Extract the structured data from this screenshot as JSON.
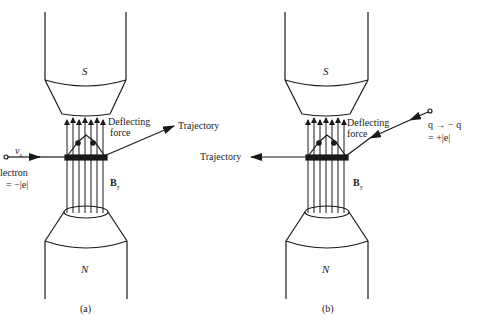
{
  "panels": [
    {
      "id": "a",
      "caption": "(a)",
      "top_pole": "S",
      "bottom_pole": "N",
      "field_label": "B",
      "field_subscript": "y",
      "force_label_line1": "Deflecting",
      "force_label_line2": "force",
      "trajectory_label": "Trajectory",
      "velocity_label": "v",
      "velocity_subscript": "x",
      "particle_label": "lectron",
      "charge_label": "= −|e|"
    },
    {
      "id": "b",
      "caption": "(b)",
      "top_pole": "S",
      "bottom_pole": "N",
      "field_label": "B",
      "field_subscript": "y",
      "force_label_line1": "Deflecting",
      "force_label_line2": "force",
      "trajectory_label": "Trajectory",
      "particle_label": "q → − q",
      "charge_label": "= +|e|"
    }
  ],
  "colors": {
    "ink": "#1a1a1a",
    "background": "#ffffff"
  }
}
